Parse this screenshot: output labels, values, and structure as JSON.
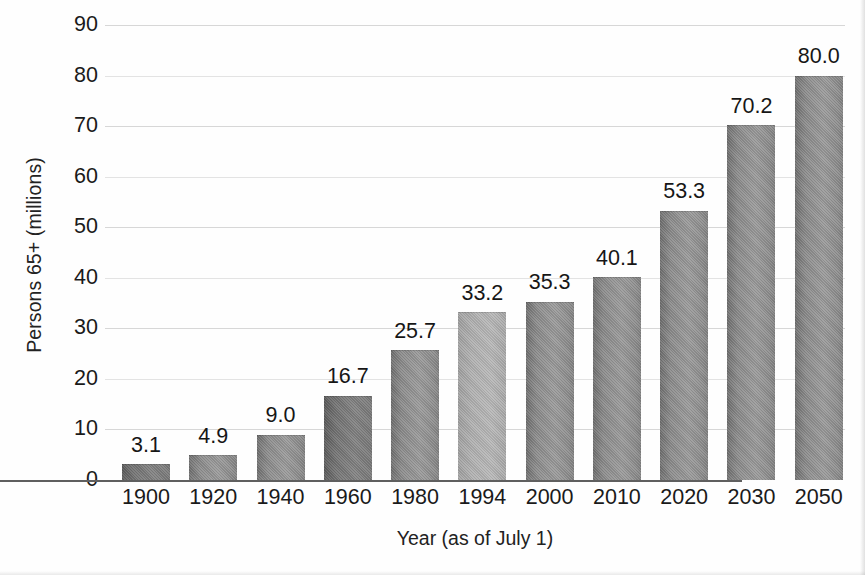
{
  "chart_data": {
    "type": "bar",
    "title": "",
    "subtitle": "",
    "xlabel": "Year (as of July 1)",
    "ylabel": "Persons 65+ (millions)",
    "categories": [
      "1900",
      "1920",
      "1940",
      "1960",
      "1980",
      "1994",
      "2000",
      "2010",
      "2020",
      "2030",
      "2050"
    ],
    "values": [
      3.1,
      4.9,
      9.0,
      16.7,
      25.7,
      33.2,
      35.3,
      40.1,
      53.3,
      70.2,
      80.0
    ],
    "data_labels": [
      "3.1",
      "4.9",
      "9.0",
      "16.7",
      "25.7",
      "33.2",
      "35.3",
      "40.1",
      "53.3",
      "70.2",
      "80.0"
    ],
    "ylim": [
      0,
      90
    ],
    "ytick_step": 10,
    "ytick_labels": [
      "90",
      "80",
      "70",
      "60",
      "50",
      "40",
      "30",
      "20",
      "10",
      "0"
    ],
    "ytick_values": [
      90,
      80,
      70,
      60,
      50,
      40,
      30,
      20,
      10,
      0
    ],
    "grid": true,
    "grid_axis": "y",
    "legend": false,
    "legend_position": "none",
    "series": [
      {
        "name": "Persons 65+ (millions)",
        "values": [
          3.1,
          4.9,
          9.0,
          16.7,
          25.7,
          33.2,
          35.3,
          40.1,
          53.3,
          70.2,
          80.0
        ]
      }
    ],
    "bar_shades": [
      "dark",
      "default",
      "default",
      "dark",
      "default",
      "light",
      "default",
      "default",
      "default",
      "default",
      "default"
    ],
    "colors": {
      "bar_fill_mid": "#8e8e8e",
      "bar_fill_dark": "#6f6f6f",
      "bar_fill_light": "#aaaaaa",
      "gridline": "#d7d7d7",
      "baseline": "#5f5f5f",
      "text": "#1a1a1a",
      "background": "#fefefe"
    }
  }
}
